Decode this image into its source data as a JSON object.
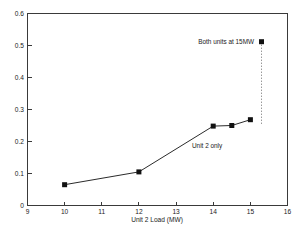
{
  "chart_data": {
    "type": "line",
    "title": "",
    "xlabel": "Unit 2 Load (MW)",
    "ylabel": "",
    "xlim": [
      9,
      16
    ],
    "ylim": [
      0,
      0.6
    ],
    "xticks": [
      9,
      10,
      11,
      12,
      13,
      14,
      15,
      16
    ],
    "xticklabels": [
      "9",
      "10",
      "11",
      "12",
      "13",
      "14",
      "15",
      "16"
    ],
    "yticks": [
      0,
      0.1,
      0.2,
      0.3,
      0.4,
      0.5,
      0.6
    ],
    "yticklabels": [
      "0",
      "0.1",
      "0.2",
      "0.3",
      "0.4",
      "0.5",
      "0.6"
    ],
    "grid": false,
    "legend": "none",
    "marker": "filled-square",
    "series": [
      {
        "name": "Unit 2 only",
        "x": [
          10,
          12,
          14,
          14.5,
          15
        ],
        "values": [
          0.065,
          0.105,
          0.248,
          0.25,
          0.268
        ]
      },
      {
        "name": "Both units at 15MW",
        "x": [
          15.3
        ],
        "values": [
          0.512
        ]
      }
    ],
    "annotations": [
      {
        "text": "Both units at 15MW",
        "x": 15.2,
        "y": 0.515
      },
      {
        "text": "Unit 2 only",
        "x": 14.05,
        "y": 0.215
      }
    ]
  },
  "axes": {
    "x_axis_title": "Unit 2 Load (MW)"
  },
  "labels": {
    "annotation_both_units": "Both units at 15MW",
    "annotation_unit2_only": "Unit 2 only"
  },
  "colors": {
    "line": "#2b2b2b",
    "marker": "#111111",
    "frame": "#3a3a3a",
    "connector": "#5a5a5a",
    "background": "#ffffff",
    "text": "#1a1a1a"
  }
}
